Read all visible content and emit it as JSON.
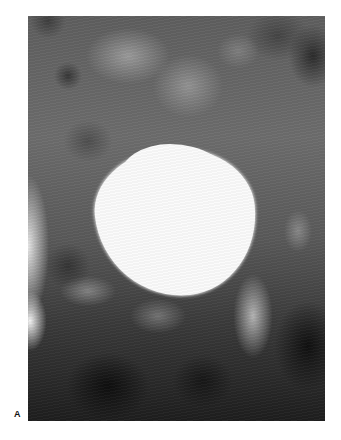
{
  "figure": {
    "panel_label": "A",
    "image": {
      "type": "radiograph",
      "description": "Contrast-filled bladder radiograph (cystogram) with a bright, rounded opacity centered in the pelvis surrounded by bowel gas and pelvic bones",
      "bright_region_color": "#fbfbfb",
      "background_tone": "#6a6a6a"
    }
  }
}
